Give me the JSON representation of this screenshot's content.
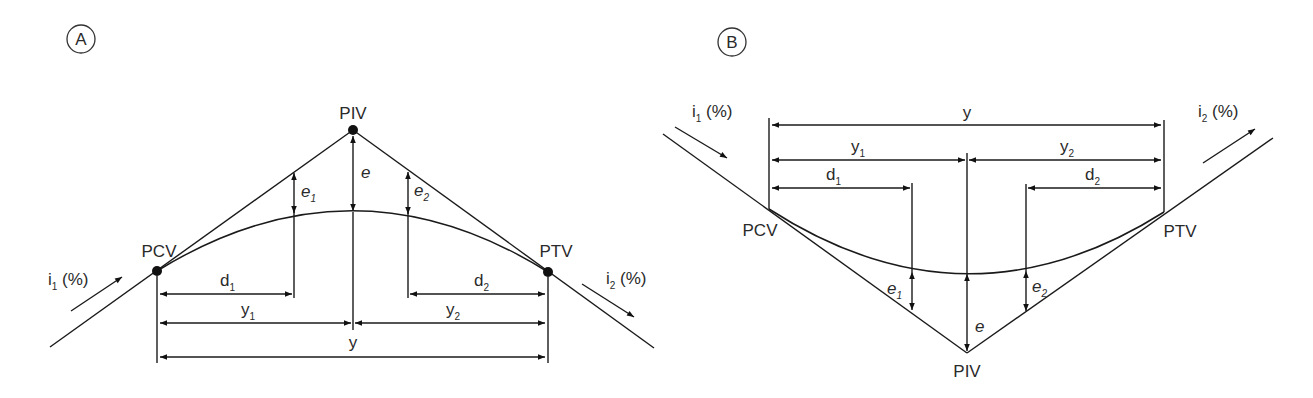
{
  "figure": {
    "panels": [
      {
        "id": "A",
        "badge": "A",
        "kind": "crest",
        "points": {
          "pcv": "PCV",
          "piv": "PIV",
          "ptv": "PTV"
        },
        "grades": {
          "in": {
            "base": "i",
            "sub": "1",
            "suffix": " (%)"
          },
          "out": {
            "base": "i",
            "sub": "2",
            "suffix": " (%)"
          }
        },
        "dimensions": {
          "e": {
            "base": "e",
            "sub": ""
          },
          "e1": {
            "base": "e",
            "sub": "1"
          },
          "e2": {
            "base": "e",
            "sub": "2"
          },
          "d1": {
            "base": "d",
            "sub": "1"
          },
          "d2": {
            "base": "d",
            "sub": "2"
          },
          "y1": {
            "base": "y",
            "sub": "1"
          },
          "y2": {
            "base": "y",
            "sub": "2"
          },
          "y": {
            "base": "y",
            "sub": ""
          }
        }
      },
      {
        "id": "B",
        "badge": "B",
        "kind": "sag",
        "points": {
          "pcv": "PCV",
          "piv": "PIV",
          "ptv": "PTV"
        },
        "grades": {
          "in": {
            "base": "i",
            "sub": "1",
            "suffix": " (%)"
          },
          "out": {
            "base": "i",
            "sub": "2",
            "suffix": " (%)"
          }
        },
        "dimensions": {
          "e": {
            "base": "e",
            "sub": ""
          },
          "e1": {
            "base": "e",
            "sub": "1"
          },
          "e2": {
            "base": "e",
            "sub": "2"
          },
          "d1": {
            "base": "d",
            "sub": "1"
          },
          "d2": {
            "base": "d",
            "sub": "2"
          },
          "y1": {
            "base": "y",
            "sub": "1"
          },
          "y2": {
            "base": "y",
            "sub": "2"
          },
          "y": {
            "base": "y",
            "sub": ""
          }
        }
      }
    ]
  }
}
